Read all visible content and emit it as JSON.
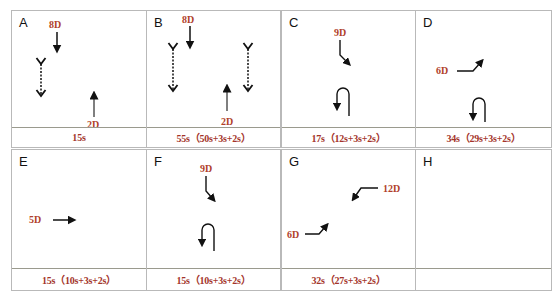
{
  "panels": [
    {
      "id": "A",
      "letter": "A",
      "duration": "15s",
      "labels": [
        "8D",
        "2D"
      ]
    },
    {
      "id": "B",
      "letter": "B",
      "duration": "55s（50s+3s+2s）",
      "labels": [
        "8D",
        "2D"
      ]
    },
    {
      "id": "C",
      "letter": "C",
      "duration": "17s（12s+3s+2s）",
      "labels": [
        "9D"
      ]
    },
    {
      "id": "D",
      "letter": "D",
      "duration": "34s（29s+3s+2s）",
      "labels": [
        "6D"
      ]
    },
    {
      "id": "E",
      "letter": "E",
      "duration": "15s（10s+3s+2s）",
      "labels": [
        "5D"
      ]
    },
    {
      "id": "F",
      "letter": "F",
      "duration": "15s（10s+3s+2s）",
      "labels": [
        "9D"
      ]
    },
    {
      "id": "G",
      "letter": "G",
      "duration": "32s（27s+3s+2s）",
      "labels": [
        "6D",
        "12D"
      ]
    },
    {
      "id": "H",
      "letter": "H",
      "duration": "",
      "labels": []
    }
  ],
  "colors": {
    "label": "#b0402a",
    "border": "#b9b9b9",
    "arrow": "#111111"
  }
}
